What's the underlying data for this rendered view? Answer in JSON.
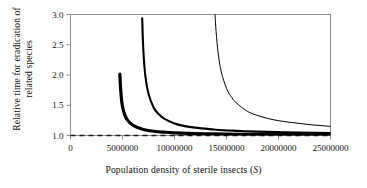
{
  "figure": {
    "background": "#ffffff",
    "frame_color": "#8e8e8e",
    "curve_color": "#000000"
  },
  "axis_labels": {
    "y_line1": "Relative time for eradication of",
    "y_line2": "related species",
    "x_prefix": "Population density of sterile insects (",
    "x_symbol": "S",
    "x_suffix": ")"
  },
  "ticks": {
    "y": [
      "1.0",
      "1.5",
      "2.0",
      "2.5",
      "3.0"
    ],
    "x": [
      "0",
      "5000000",
      "10000000",
      "15000000",
      "20000000",
      "25000000"
    ]
  },
  "chart_data": {
    "type": "line",
    "title": "",
    "xlabel": "Population density of sterile insects (S)",
    "ylabel": "Relative time for eradication of related species",
    "xlim": [
      0,
      25000000
    ],
    "ylim": [
      1.0,
      3.0
    ],
    "xticks": [
      0,
      5000000,
      10000000,
      15000000,
      20000000,
      25000000
    ],
    "yticks": [
      1.0,
      1.5,
      2.0,
      2.5,
      3.0
    ],
    "grid": false,
    "legend": "none",
    "annotations": [
      {
        "name": "asymptote-line",
        "kind": "horizontal-dashed-line",
        "y": 1.0,
        "label": "relative time = 1.0"
      }
    ],
    "series": [
      {
        "name": "curve-1-thick",
        "linewidth": 3.2,
        "asymptote_x": 4700000,
        "y_at_start": 2.0,
        "x": [
          4750000,
          4800000,
          4900000,
          5000000,
          5200000,
          5500000,
          6000000,
          6500000,
          7000000,
          8000000,
          9000000,
          10000000,
          12000000,
          14000000,
          16000000,
          18000000,
          20000000,
          22000000,
          25000000
        ],
        "y": [
          2.0,
          1.82,
          1.6,
          1.48,
          1.35,
          1.25,
          1.17,
          1.13,
          1.1,
          1.07,
          1.055,
          1.045,
          1.033,
          1.026,
          1.021,
          1.018,
          1.015,
          1.013,
          1.011
        ]
      },
      {
        "name": "curve-2-medium",
        "linewidth": 2.1,
        "asymptote_x": 6800000,
        "y_at_start": 2.9,
        "x": [
          6900000,
          7000000,
          7200000,
          7500000,
          8000000,
          8500000,
          9000000,
          10000000,
          11000000,
          12000000,
          14000000,
          16000000,
          18000000,
          20000000,
          22000000,
          25000000
        ],
        "y": [
          2.9,
          2.42,
          1.98,
          1.69,
          1.46,
          1.35,
          1.28,
          1.2,
          1.155,
          1.13,
          1.095,
          1.077,
          1.064,
          1.055,
          1.048,
          1.04
        ]
      },
      {
        "name": "curve-3-thin",
        "linewidth": 1.0,
        "asymptote_x": 13600000,
        "y_at_start": 3.0,
        "x": [
          13900000,
          14000000,
          14200000,
          14500000,
          15000000,
          15500000,
          16000000,
          17000000,
          18000000,
          19000000,
          20000000,
          21000000,
          22000000,
          23000000,
          24000000,
          25000000
        ],
        "y": [
          3.0,
          2.72,
          2.36,
          2.05,
          1.78,
          1.63,
          1.53,
          1.4,
          1.33,
          1.28,
          1.245,
          1.22,
          1.2,
          1.18,
          1.165,
          1.15
        ]
      }
    ]
  }
}
